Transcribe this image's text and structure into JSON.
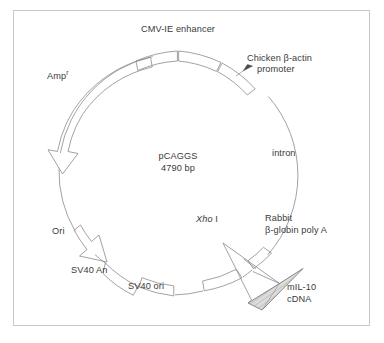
{
  "figure": {
    "kind": "plasmid-map",
    "title_internal": "pCAGGS plasmid vector map with mIL-10 cDNA insert",
    "background_color": "#ffffff",
    "frame_color": "#c8c8c8",
    "line_color": "#8a8a8a",
    "text_color": "#3a3a3a",
    "insert_fill": "#d9d9d9"
  },
  "plasmid": {
    "name": "pCAGGS",
    "size": "4790 bp"
  },
  "features": {
    "cmv_enhancer": "CMV-IE enhancer",
    "chicken_promoter_line1": "Chicken β-actin",
    "chicken_promoter_line2": "promoter",
    "intron": "intron",
    "rabbit_polyA_line1": "Rabbit",
    "rabbit_polyA_line2": "β-globin poly A",
    "sv40_ori": "SV40 ori",
    "sv40_an": "SV40 An",
    "ori": "Ori",
    "amp_base": "Amp",
    "amp_sup": "r"
  },
  "restriction_site": {
    "enzyme_italic": "Xho",
    "enzyme_roman": "I"
  },
  "insert": {
    "line1": "mIL-10",
    "line2": "cDNA"
  }
}
